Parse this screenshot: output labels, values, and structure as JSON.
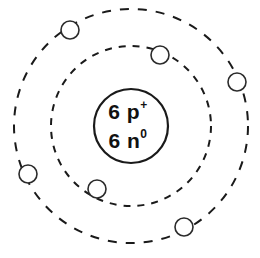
{
  "figure": {
    "element_name": "Carbon",
    "background_color": "#ffffff",
    "line_color": "#1a1a1a",
    "electron_fill_color": "#ffffff",
    "electron_stroke_color": "#2b2b2b"
  },
  "nucleus": {
    "center_x": 131,
    "center_y": 126,
    "radius": 37,
    "proton_count_label": "6",
    "proton_symbol": "p",
    "proton_charge": "+",
    "neutron_count_label": "6",
    "neutron_symbol": "n",
    "neutron_charge": "0",
    "line1": "6 p",
    "line2": "6 n"
  },
  "shells": [
    {
      "name": "inner-shell",
      "index": 1,
      "radius": 80,
      "electron_count": 2,
      "dash": "7 7",
      "electrons": [
        {
          "name": "inner-electron-1",
          "cx": 160,
          "cy": 55,
          "r": 9
        },
        {
          "name": "inner-electron-2",
          "cx": 97,
          "cy": 189,
          "r": 9
        }
      ]
    },
    {
      "name": "outer-shell",
      "index": 2,
      "radius": 117,
      "electron_count": 4,
      "dash": "9 9",
      "electrons": [
        {
          "name": "outer-electron-1",
          "cx": 70,
          "cy": 30,
          "r": 9
        },
        {
          "name": "outer-electron-2",
          "cx": 237,
          "cy": 82,
          "r": 9
        },
        {
          "name": "outer-electron-3",
          "cx": 28,
          "cy": 174,
          "r": 9
        },
        {
          "name": "outer-electron-4",
          "cx": 184,
          "cy": 227,
          "r": 9
        }
      ]
    }
  ],
  "chart_data": {
    "type": "diagram",
    "subtitle": "",
    "nucleus_labels": [
      "6 p+",
      "6 n0"
    ],
    "protons": 6,
    "neutrons": 6,
    "electron_shell_configuration": [
      2,
      4
    ],
    "total_electrons": 6,
    "categories": [
      "Shell 1",
      "Shell 2"
    ],
    "values": [
      2,
      4
    ],
    "xlabel": "Electron shell",
    "ylabel": "Electron count",
    "legend": [],
    "annotations": [
      "6 p+",
      "6 n0"
    ],
    "grid": false
  }
}
